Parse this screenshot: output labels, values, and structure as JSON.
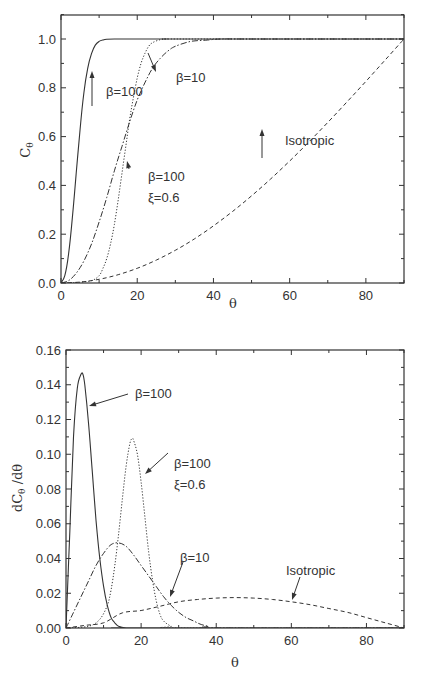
{
  "chart_data": [
    {
      "type": "line",
      "title": "",
      "xlabel": "θ",
      "ylabel": "Cθ",
      "xlim": [
        0,
        90
      ],
      "ylim": [
        0.0,
        1.1
      ],
      "grid": false,
      "legend": "none (inline annotations)",
      "x_ticks": [
        0,
        20,
        40,
        60,
        80
      ],
      "x_tick_labels": [
        "0",
        "20",
        "40",
        "60",
        "80"
      ],
      "y_ticks": [
        0.0,
        0.2,
        0.4,
        0.6,
        0.8,
        1.0
      ],
      "y_tick_labels": [
        "0.0",
        "0.2",
        "0.4",
        "0.6",
        "0.8",
        "1.0"
      ],
      "series": [
        {
          "name": "β=100",
          "style": "solid",
          "x": [
            0,
            1,
            2,
            3,
            4,
            5,
            6,
            7,
            8,
            9,
            10,
            11,
            12,
            14,
            16,
            20,
            30,
            90
          ],
          "y": [
            0,
            0.03,
            0.12,
            0.27,
            0.45,
            0.63,
            0.78,
            0.88,
            0.94,
            0.975,
            0.99,
            0.996,
            0.999,
            1.0,
            1.0,
            1.0,
            1.0,
            1.0
          ]
        },
        {
          "name": "β=10",
          "style": "dashdot",
          "x": [
            0,
            2,
            4,
            6,
            8,
            10,
            12,
            14,
            16,
            18,
            20,
            22,
            24,
            26,
            28,
            30,
            34,
            38,
            42,
            50,
            90
          ],
          "y": [
            0,
            0.01,
            0.04,
            0.09,
            0.16,
            0.25,
            0.35,
            0.46,
            0.56,
            0.66,
            0.75,
            0.82,
            0.88,
            0.92,
            0.95,
            0.97,
            0.99,
            0.995,
            1.0,
            1.0,
            1.0
          ]
        },
        {
          "name": "β=100 ξ=0.6",
          "style": "dotted",
          "x": [
            0,
            4,
            8,
            10,
            11,
            12,
            13,
            14,
            15,
            16,
            17,
            18,
            19,
            20,
            21,
            22,
            23,
            24,
            26,
            28,
            32,
            90
          ],
          "y": [
            0,
            0.002,
            0.01,
            0.03,
            0.06,
            0.1,
            0.16,
            0.24,
            0.34,
            0.45,
            0.56,
            0.67,
            0.76,
            0.84,
            0.9,
            0.94,
            0.97,
            0.985,
            0.997,
            1.0,
            1.0,
            1.0
          ]
        },
        {
          "name": "Isotropic",
          "style": "dashed",
          "x": [
            0,
            5,
            10,
            15,
            20,
            25,
            30,
            35,
            40,
            45,
            50,
            55,
            60,
            65,
            70,
            75,
            80,
            85,
            90
          ],
          "y": [
            0,
            0.0038,
            0.0152,
            0.0341,
            0.0603,
            0.0937,
            0.134,
            0.1808,
            0.234,
            0.2929,
            0.3572,
            0.4264,
            0.5,
            0.5774,
            0.658,
            0.7412,
            0.8264,
            0.9128,
            1.0
          ]
        }
      ],
      "annotations": [
        {
          "text": "β=100",
          "target": "β=100",
          "at": [
            8.5,
            0.87
          ]
        },
        {
          "text": "β=10",
          "target": "β=10",
          "at": [
            23,
            0.87
          ]
        },
        {
          "text": "β=100",
          "line2": "ξ=0.6",
          "target": "β=100 ξ=0.6",
          "at": [
            17.5,
            0.49
          ]
        },
        {
          "text": "Isotropic",
          "target": "Isotropic",
          "at": [
            52,
            0.63
          ]
        }
      ]
    },
    {
      "type": "line",
      "title": "",
      "xlabel": "θ",
      "ylabel": "dCθ /dθ",
      "xlim": [
        0,
        90
      ],
      "ylim": [
        0.0,
        0.16
      ],
      "grid": false,
      "legend": "none (inline annotations)",
      "x_ticks": [
        0,
        20,
        40,
        60,
        80
      ],
      "x_tick_labels": [
        "0",
        "20",
        "40",
        "60",
        "80"
      ],
      "y_ticks": [
        0.0,
        0.02,
        0.04,
        0.06,
        0.08,
        0.1,
        0.12,
        0.14,
        0.16
      ],
      "y_tick_labels": [
        "0.00",
        "0.02",
        "0.04",
        "0.06",
        "0.08",
        "0.10",
        "0.12",
        "0.14",
        "0.16"
      ],
      "series": [
        {
          "name": "β=100",
          "style": "solid",
          "x": [
            0,
            1,
            2,
            3,
            4,
            4.5,
            5,
            6,
            7,
            8,
            9,
            10,
            11,
            12,
            13,
            14,
            16,
            18,
            90
          ],
          "y": [
            0,
            0.055,
            0.11,
            0.138,
            0.146,
            0.146,
            0.14,
            0.118,
            0.09,
            0.062,
            0.04,
            0.024,
            0.013,
            0.006,
            0.003,
            0.001,
            0,
            0,
            0
          ]
        },
        {
          "name": "β=10",
          "style": "dashdot",
          "x": [
            0,
            2,
            4,
            6,
            8,
            10,
            12,
            14,
            16,
            18,
            20,
            22,
            24,
            26,
            28,
            30,
            32,
            34,
            36,
            38,
            40,
            90
          ],
          "y": [
            0,
            0.009,
            0.018,
            0.027,
            0.036,
            0.043,
            0.048,
            0.049,
            0.047,
            0.042,
            0.036,
            0.03,
            0.024,
            0.018,
            0.013,
            0.009,
            0.006,
            0.004,
            0.002,
            0.001,
            0,
            0
          ]
        },
        {
          "name": "β=100 ξ=0.6",
          "style": "dotted",
          "x": [
            0,
            6,
            9,
            11,
            12,
            13,
            14,
            15,
            16,
            17,
            17.6,
            18,
            19,
            20,
            21,
            22,
            23,
            24,
            25,
            26,
            28,
            30,
            90
          ],
          "y": [
            0,
            0.001,
            0.005,
            0.013,
            0.022,
            0.036,
            0.054,
            0.074,
            0.093,
            0.106,
            0.109,
            0.108,
            0.1,
            0.084,
            0.064,
            0.044,
            0.028,
            0.016,
            0.008,
            0.004,
            0.001,
            0,
            0
          ]
        },
        {
          "name": "Isotropic",
          "style": "dashed",
          "x": [
            0,
            5,
            10,
            15,
            20,
            25,
            30,
            35,
            40,
            45,
            50,
            55,
            60,
            65,
            70,
            75,
            80,
            85,
            90
          ],
          "y": [
            0,
            0.0015,
            0.003,
            0.0087,
            0.0101,
            0.0125,
            0.0151,
            0.0164,
            0.0172,
            0.0175,
            0.0172,
            0.0164,
            0.0151,
            0.0134,
            0.0112,
            0.009,
            0.006,
            0.003,
            0
          ]
        }
      ],
      "annotations": [
        {
          "text": "β=100",
          "target": "β=100",
          "at": [
            6,
            0.12
          ]
        },
        {
          "text": "β=100",
          "line2": "ξ=0.6",
          "target": "β=100 ξ=0.6",
          "at": [
            21,
            0.087
          ]
        },
        {
          "text": "β=10",
          "target": "β=10",
          "at": [
            27,
            0.018
          ]
        },
        {
          "text": "Isotropic",
          "target": "Isotropic",
          "at": [
            60,
            0.0155
          ]
        }
      ]
    }
  ]
}
